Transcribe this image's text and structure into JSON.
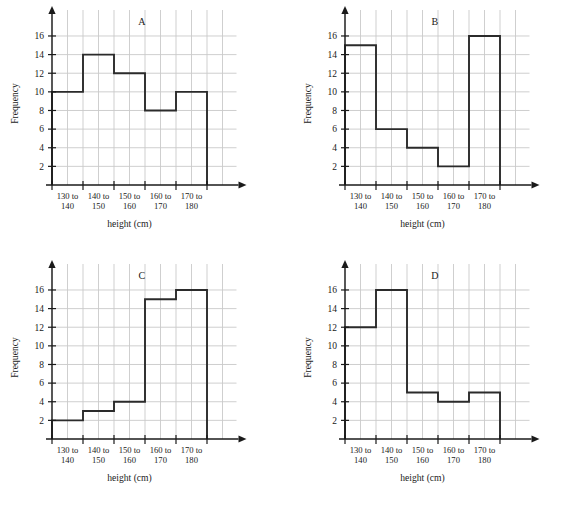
{
  "figure": {
    "panel_count": 4,
    "shared_xlabel": "height (cm)",
    "shared_ylabel": "Frequency",
    "shared_categories": [
      {
        "line1": "130 to",
        "line2": "140"
      },
      {
        "line1": "140 to",
        "line2": "150"
      },
      {
        "line1": "150 to",
        "line2": "160"
      },
      {
        "line1": "160 to",
        "line2": "170"
      },
      {
        "line1": "170 to",
        "line2": "180"
      }
    ],
    "shared_yticks": [
      2,
      4,
      6,
      8,
      10,
      12,
      14,
      16
    ],
    "colors": {
      "background": "#ffffff",
      "gridline": "#c9c9c9",
      "axis": "#1a1a1a",
      "bar_outline": "#2b2b2b",
      "text": "#1a1a1a"
    }
  },
  "chart_data": [
    {
      "type": "bar",
      "title": "A",
      "categories": [
        "130 to 140",
        "140 to 150",
        "150 to 160",
        "160 to 170",
        "170 to 180"
      ],
      "values": [
        10,
        14,
        12,
        8,
        10
      ],
      "xlabel": "height (cm)",
      "ylabel": "Frequency",
      "ylim": [
        0,
        17.5
      ],
      "yticks": [
        2,
        4,
        6,
        8,
        10,
        12,
        14,
        16
      ],
      "grid": true,
      "legend": "none"
    },
    {
      "type": "bar",
      "title": "B",
      "categories": [
        "130 to 140",
        "140 to 150",
        "150 to 160",
        "160 to 170",
        "170 to 180"
      ],
      "values": [
        15,
        6,
        4,
        2,
        16
      ],
      "xlabel": "height (cm)",
      "ylabel": "Frequency",
      "ylim": [
        0,
        17.5
      ],
      "yticks": [
        2,
        4,
        6,
        8,
        10,
        12,
        14,
        16
      ],
      "grid": true,
      "legend": "none"
    },
    {
      "type": "bar",
      "title": "C",
      "categories": [
        "130 to 140",
        "140 to 150",
        "150 to 160",
        "160 to 170",
        "170 to 180"
      ],
      "values": [
        2,
        3,
        4,
        15,
        16
      ],
      "xlabel": "height (cm)",
      "ylabel": "Frequency",
      "ylim": [
        0,
        17.5
      ],
      "yticks": [
        2,
        4,
        6,
        8,
        10,
        12,
        14,
        16
      ],
      "grid": true,
      "legend": "none"
    },
    {
      "type": "bar",
      "title": "D",
      "categories": [
        "130 to 140",
        "140 to 150",
        "150 to 160",
        "160 to 170",
        "170 to 180"
      ],
      "values": [
        12,
        16,
        5,
        4,
        5
      ],
      "xlabel": "height (cm)",
      "ylabel": "Frequency",
      "ylim": [
        0,
        17.5
      ],
      "yticks": [
        2,
        4,
        6,
        8,
        10,
        12,
        14,
        16
      ],
      "grid": true,
      "legend": "none"
    }
  ]
}
